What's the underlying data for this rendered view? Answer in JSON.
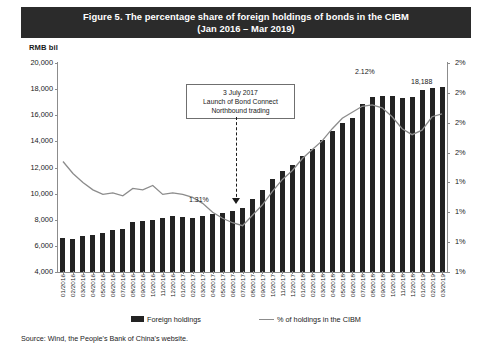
{
  "title": {
    "line1": "Figure 5.  The percentage share of foreign holdings of bonds in the CIBM",
    "line2": "(Jan 2016 – Mar 2019)"
  },
  "unit_label": "RMB bil",
  "source": "Source: Wind, the People's Bank of China's website.",
  "legend": {
    "bar_label": "Foreign holdings",
    "line_label": "% of holdings in the CIBM"
  },
  "annotation": {
    "line1": "3 July 2017",
    "line2": "Launch of Bond Connect",
    "line3": "Northbound trading"
  },
  "data_labels": {
    "low_point": "1.31%",
    "peak": "2.12%",
    "last_bar": "18,188"
  },
  "colors": {
    "title_bar": "#2b2b2b",
    "bar": "#232323",
    "line": "#8c8c8c",
    "axis": "#8c8c8c",
    "background": "#ffffff"
  },
  "chart_data": {
    "type": "bar",
    "title": "Figure 5.  The percentage share of foreign holdings of bonds in the CIBM (Jan 2016 – Mar 2019)",
    "xlabel": "",
    "ylabel": "RMB bil",
    "ylabel_right": "%",
    "ylim": [
      4000,
      20000
    ],
    "yticks": [
      4000,
      6000,
      8000,
      10000,
      12000,
      14000,
      16000,
      18000,
      20000
    ],
    "ytick_labels": [
      "4,000",
      "6,000",
      "8,000",
      "10,000",
      "12,000",
      "14,000",
      "16,000",
      "18,000",
      "20,000"
    ],
    "ylim_right": [
      1.0,
      2.4
    ],
    "yticks_right": [
      1.0,
      1.2,
      1.4,
      1.6,
      1.8,
      2.0,
      2.2,
      2.4
    ],
    "ytick_labels_right": [
      "1%",
      "1%",
      "1%",
      "1%",
      "2%",
      "2%",
      "2%",
      "2%"
    ],
    "grid": false,
    "legend_position": "bottom",
    "categories": [
      "01/2016",
      "02/2016",
      "03/2016",
      "04/2016",
      "05/2016",
      "06/2016",
      "07/2016",
      "08/2016",
      "09/2016",
      "10/2016",
      "11/2016",
      "12/2016",
      "01/2017",
      "02/2017",
      "03/2017",
      "04/2017",
      "05/2017",
      "06/2017",
      "07/2017",
      "08/2017",
      "09/2017",
      "10/2017",
      "11/2017",
      "12/2017",
      "01/2018",
      "02/2018",
      "03/2018",
      "04/2018",
      "05/2018",
      "06/2018",
      "07/2018",
      "08/2018",
      "09/2018",
      "10/2018",
      "11/2018",
      "12/2018",
      "01/2019",
      "02/2019",
      "03/2019"
    ],
    "series": [
      {
        "name": "Foreign holdings",
        "type": "bar",
        "axis": "left",
        "unit": "RMB bil",
        "values": [
          6620,
          6560,
          6720,
          6800,
          6960,
          7230,
          7290,
          7840,
          7900,
          8020,
          8120,
          8260,
          8200,
          8170,
          8300,
          8420,
          8540,
          8700,
          8900,
          9600,
          10300,
          11100,
          11700,
          12200,
          12900,
          13400,
          14100,
          14800,
          15400,
          15800,
          16900,
          17400,
          17500,
          17500,
          17300,
          17400,
          17900,
          18100,
          18188
        ]
      },
      {
        "name": "% of holdings in the CIBM",
        "type": "line",
        "axis": "right",
        "unit": "%",
        "values": [
          1.74,
          1.66,
          1.6,
          1.55,
          1.52,
          1.53,
          1.51,
          1.56,
          1.55,
          1.58,
          1.52,
          1.53,
          1.52,
          1.5,
          1.46,
          1.4,
          1.36,
          1.33,
          1.31,
          1.38,
          1.45,
          1.54,
          1.62,
          1.68,
          1.76,
          1.82,
          1.88,
          1.96,
          2.03,
          2.07,
          2.11,
          2.12,
          2.1,
          2.04,
          1.96,
          1.92,
          1.95,
          2.04,
          2.06
        ]
      }
    ],
    "annotations": [
      {
        "text": "3 July 2017 / Launch of Bond Connect Northbound trading",
        "points_to": "07/2017"
      },
      {
        "text": "1.31%",
        "series": "% of holdings in the CIBM",
        "category": "07/2017",
        "value": 1.31
      },
      {
        "text": "2.12%",
        "series": "% of holdings in the CIBM",
        "category": "08/2018",
        "value": 2.12
      },
      {
        "text": "18,188",
        "series": "Foreign holdings",
        "category": "03/2019",
        "value": 18188
      }
    ]
  }
}
